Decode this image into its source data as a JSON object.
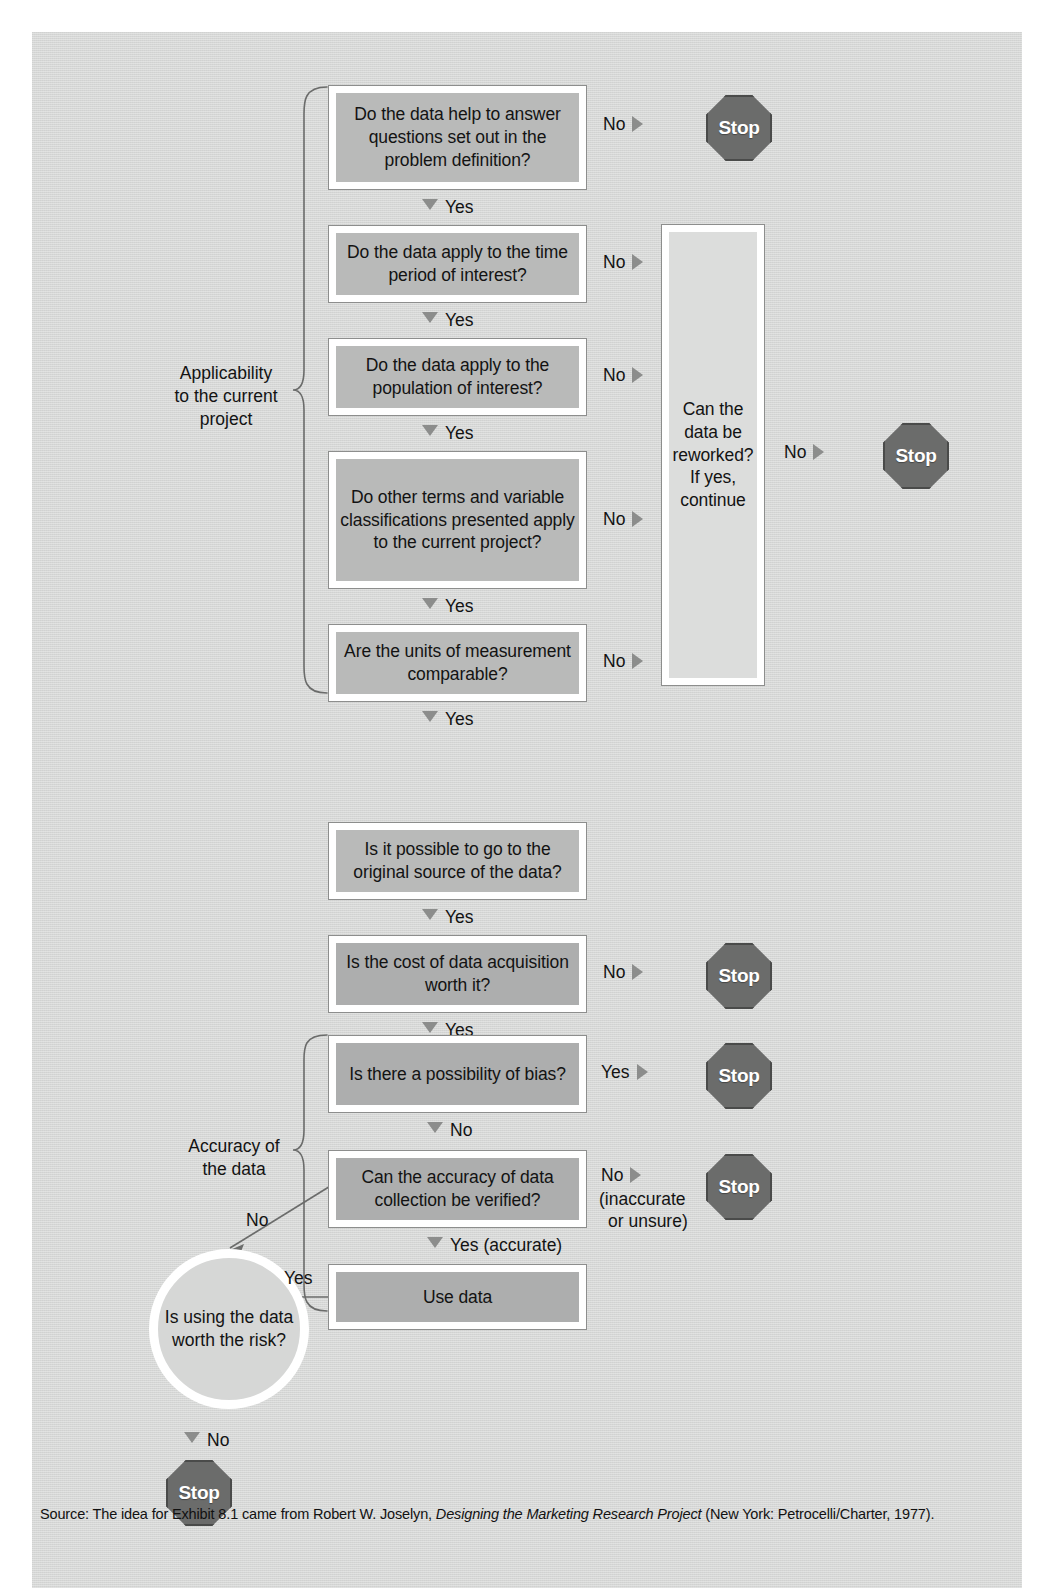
{
  "exhibit": {
    "title": "Evaluating Secondary Data Flowchart",
    "panel_color": "#d6d7d6",
    "box_fill": "#b9bab9",
    "stop_fill": "#6b6c6b"
  },
  "group_labels": {
    "applicability": "Applicability\nto the current\nproject",
    "applicability_lines": [
      "Applicability",
      "to the current",
      "project"
    ],
    "accuracy": "Accuracy of\nthe data",
    "accuracy_lines": [
      "Accuracy of",
      "the data"
    ]
  },
  "nodes": {
    "q1": {
      "text": "Do the data help to answer questions set out in the problem definition?"
    },
    "q2": {
      "text": "Do the data apply to the time period of interest?"
    },
    "q3": {
      "text": "Do the data apply to the population of interest?"
    },
    "q4": {
      "text": "Do other terms and variable classifications presented apply to the current project?"
    },
    "q5": {
      "text": "Are the units of measurement comparable?"
    },
    "rework": {
      "text": "Can the data be reworked? If yes, continue"
    },
    "q6": {
      "text": "Is it possible to go to the original source of the data?"
    },
    "q7": {
      "text": "Is the cost of data acquisition worth it?"
    },
    "q8": {
      "text": "Is there a possibility of bias?"
    },
    "q9": {
      "text": "Can the accuracy of data collection be verified?"
    },
    "use": {
      "text": "Use data"
    },
    "risk": {
      "text": "Is using the data worth the risk?"
    }
  },
  "stops": {
    "stop1": "Stop",
    "stop_rework": "Stop",
    "stop_cost": "Stop",
    "stop_bias": "Stop",
    "stop_accuracy": "Stop",
    "stop_risk": "Stop"
  },
  "connectors": {
    "q1_no": "No",
    "q1_yes": "Yes",
    "q2_no": "No",
    "q2_yes": "Yes",
    "q3_no": "No",
    "q3_yes": "Yes",
    "q4_no": "No",
    "q4_yes": "Yes",
    "q5_no": "No",
    "q5_yes": "Yes",
    "rework_no": "No",
    "q6_yes": "Yes",
    "q7_no": "No",
    "q7_yes": "Yes",
    "q8_yes": "Yes",
    "q8_no": "No",
    "q9_no": "No",
    "q9_no_paren_line1": "(inaccurate",
    "q9_no_paren_line2": "or unsure)",
    "q9_yes": "Yes (accurate)",
    "risk_yes": "Yes",
    "risk_no_in": "No",
    "risk_no_out": "No"
  },
  "source": {
    "prefix": "Source: The idea for Exhibit 8.1 came from Robert W. Joselyn, ",
    "italic": "Designing the Marketing Research Project",
    "suffix": " (New York: Petrocelli/Charter, 1977)."
  }
}
